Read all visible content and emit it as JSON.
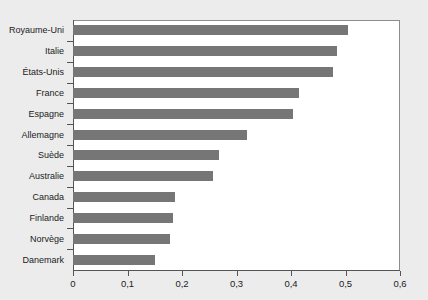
{
  "chart_data": {
    "type": "bar",
    "orientation": "horizontal",
    "title": "",
    "subtitle": "",
    "xlabel": "",
    "ylabel": "",
    "xlim": [
      0,
      0.6
    ],
    "grid": false,
    "legend": null,
    "decimal_separator": ",",
    "categories": [
      "Royaume-Uni",
      "Italie",
      "États-Unis",
      "France",
      "Espagne",
      "Allemagne",
      "Suède",
      "Australie",
      "Canada",
      "Finlande",
      "Norvège",
      "Danemark"
    ],
    "values": [
      0.505,
      0.485,
      0.477,
      0.415,
      0.403,
      0.319,
      0.268,
      0.257,
      0.188,
      0.183,
      0.178,
      0.151
    ],
    "xticks": [
      0,
      0.1,
      0.2,
      0.3,
      0.4,
      0.5,
      0.6
    ],
    "xtick_labels": [
      "0",
      "0,1",
      "0,2",
      "0,3",
      "0,4",
      "0,5",
      "0,6"
    ],
    "bar_color": "#767676",
    "plot_background": "#ffffff",
    "page_background": "#ececed",
    "axis_color": "#555555"
  }
}
